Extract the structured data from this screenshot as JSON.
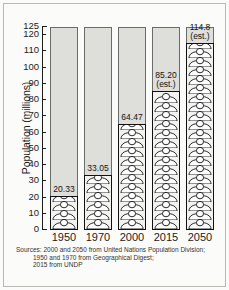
{
  "chart_data": {
    "type": "bar",
    "title": "",
    "subtitle": "",
    "xlabel": "",
    "ylabel": "Population (millions)",
    "categories": [
      "1950",
      "1970",
      "2000",
      "2015",
      "2050"
    ],
    "values": [
      20.33,
      33.05,
      64.47,
      85.2,
      114.8
    ],
    "data_labels": [
      "20.33",
      "33.05",
      "64.47",
      "85.20",
      "114.8"
    ],
    "estimate_flags": [
      "",
      "",
      "",
      "(est.)",
      "(est.)"
    ],
    "ylim": [
      0,
      125
    ],
    "yticks": [
      0,
      10,
      20,
      30,
      40,
      50,
      60,
      70,
      80,
      90,
      100,
      110,
      120,
      125
    ],
    "ytick_labels": [
      "0",
      "10",
      "20",
      "30",
      "40",
      "50",
      "60",
      "70",
      "80",
      "90",
      "100",
      "110",
      "120",
      "125"
    ],
    "grid": false,
    "legend": "none",
    "style": "pictogram-stacked-person-icons",
    "colors": {
      "column_background": "#dededb",
      "column_border": "#6b6b68",
      "bar_fill": "#f2f2ef",
      "bar_border": "#111111",
      "text": "#1c1c1c",
      "page_background": "#fbfbfa",
      "frame_border": "#b9b9b4"
    }
  },
  "axis": {
    "y_title": "Population (millions)"
  },
  "sources": {
    "line1": "Sources: 2000 and 2050 from United Nations Population Division;",
    "line2": "1950 and 1970 from Geographical Digest;",
    "line3": "2015 from UNDP"
  }
}
